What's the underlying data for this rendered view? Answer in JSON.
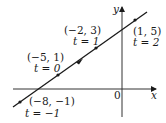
{
  "diagram": {
    "type": "parametric-line",
    "axes": {
      "x_label": "x",
      "y_label": "y",
      "origin_label": "0"
    },
    "points": [
      {
        "coord": "(−8, −1)",
        "param": "t = −1",
        "x": -8,
        "y": -1,
        "t": -1
      },
      {
        "coord": "(−5, 1)",
        "param": "t = 0",
        "x": -5,
        "y": 1,
        "t": 0
      },
      {
        "coord": "(−2, 3)",
        "param": "t = 1",
        "x": -2,
        "y": 3,
        "t": 1
      },
      {
        "coord": "(1, 5)",
        "param": "t = 2",
        "x": 1,
        "y": 5,
        "t": 2
      }
    ],
    "direction": "increasing t toward upper-right",
    "line_color": "#1a1a1a"
  }
}
